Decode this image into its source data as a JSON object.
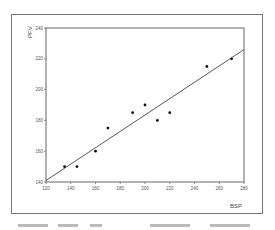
{
  "chart_data": {
    "type": "scatter",
    "title": "",
    "xlabel": "BSP",
    "ylabel": "PFV",
    "xlim": [
      120,
      280
    ],
    "ylim": [
      140,
      240
    ],
    "x_ticks": [
      120,
      140,
      160,
      180,
      200,
      220,
      240,
      260,
      280
    ],
    "y_ticks": [
      140,
      160,
      180,
      200,
      220,
      240
    ],
    "grid": false,
    "legend": null,
    "series": [
      {
        "name": "observations",
        "x": [
          135,
          145,
          160,
          170,
          190,
          200,
          210,
          220,
          250,
          270
        ],
        "y": [
          150,
          150,
          160,
          175,
          185,
          190,
          180,
          185,
          215,
          220
        ]
      }
    ],
    "fit_line": {
      "x": [
        120,
        280
      ],
      "y": [
        141,
        226
      ]
    }
  }
}
